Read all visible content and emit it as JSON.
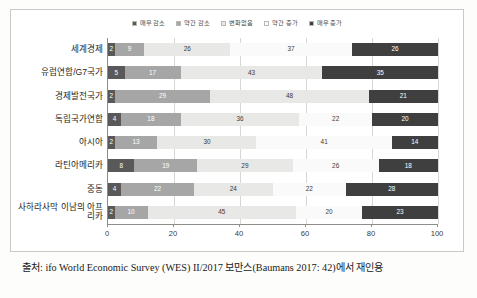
{
  "chart_data": {
    "type": "bar",
    "orientation": "horizontal",
    "stacked": true,
    "stack_mode": "percent",
    "title": "",
    "subtitle": "",
    "xlabel": "",
    "ylabel": "",
    "xlim": [
      0,
      100
    ],
    "xticks": [
      0,
      20,
      40,
      60,
      80,
      100
    ],
    "xtick_labels": [
      "0",
      "20",
      "40",
      "60",
      "80",
      "100"
    ],
    "grid": true,
    "grid_axis": "x",
    "legend_position": "top-center",
    "categories": [
      "세계경제",
      "유럽연합/G7국가",
      "경제발전국가",
      "독립국가연합",
      "아시아",
      "라틴아메리카",
      "중동",
      "사하라사막 이남의 아프리카"
    ],
    "series": [
      {
        "name": "매우 감소",
        "color": "#595959",
        "text_color": "#ffffff",
        "values": [
          2,
          5,
          2,
          4,
          2,
          8,
          4,
          2
        ]
      },
      {
        "name": "약간 감소",
        "color": "#a6a6a6",
        "text_color": "#ffffff",
        "values": [
          9,
          17,
          29,
          18,
          13,
          19,
          22,
          10
        ]
      },
      {
        "name": "변화없음",
        "color": "#e8e8e6",
        "text_color": "#3a3a38",
        "values": [
          26,
          43,
          48,
          36,
          30,
          29,
          24,
          45
        ]
      },
      {
        "name": "약간 증가",
        "color": "#fafafa",
        "text_color": "#3a3a38",
        "values": [
          37,
          0,
          0,
          22,
          41,
          26,
          22,
          20
        ]
      },
      {
        "name": "매우 증가",
        "color": "#3f3f3f",
        "text_color": "#ffffff",
        "values": [
          26,
          35,
          21,
          20,
          14,
          18,
          28,
          23
        ]
      }
    ]
  },
  "legend": {
    "items": [
      {
        "label": "매우 감소",
        "color": "#595959"
      },
      {
        "label": "약간 감소",
        "color": "#a6a6a6"
      },
      {
        "label": "변화없음",
        "color": "#e8e8e6"
      },
      {
        "label": "약간 증가",
        "color": "#fafafa"
      },
      {
        "label": "매우 증가",
        "color": "#3f3f3f"
      }
    ]
  },
  "caption": {
    "text": "출처: ifo World Economic Survey (WES) II/2017 보만스(Baumans 2017: 42)에서 재인용"
  }
}
